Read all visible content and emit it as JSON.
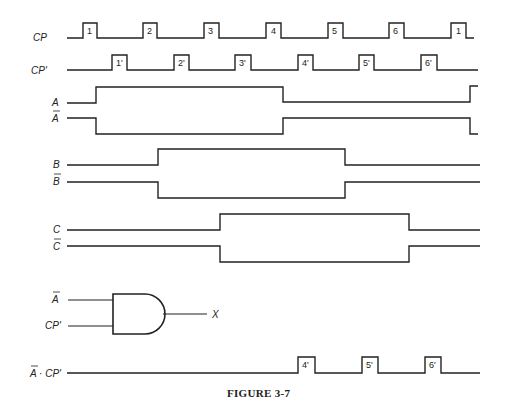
{
  "figure": {
    "caption": "FIGURE 3-7",
    "x_start": 67,
    "x_end": 480,
    "signals": [
      {
        "id": "CP",
        "label": "CP",
        "overbar": false,
        "y_high": 23,
        "y_low": 38,
        "points": [
          [
            67,
            38
          ],
          [
            83,
            38
          ],
          [
            83,
            23
          ],
          [
            97,
            23
          ],
          [
            97,
            38
          ],
          [
            143,
            38
          ],
          [
            143,
            23
          ],
          [
            157,
            23
          ],
          [
            157,
            38
          ],
          [
            204,
            38
          ],
          [
            204,
            23
          ],
          [
            219,
            23
          ],
          [
            219,
            38
          ],
          [
            266,
            38
          ],
          [
            266,
            23
          ],
          [
            281,
            23
          ],
          [
            281,
            38
          ],
          [
            328,
            38
          ],
          [
            328,
            23
          ],
          [
            343,
            23
          ],
          [
            343,
            38
          ],
          [
            389,
            38
          ],
          [
            389,
            23
          ],
          [
            404,
            23
          ],
          [
            404,
            38
          ],
          [
            451,
            38
          ],
          [
            451,
            23
          ],
          [
            466,
            23
          ],
          [
            466,
            38
          ],
          [
            474,
            38
          ]
        ],
        "pulses": [
          {
            "label": "1",
            "x": 87
          },
          {
            "label": "2",
            "x": 147
          },
          {
            "label": "3",
            "x": 208
          },
          {
            "label": "4",
            "x": 271
          },
          {
            "label": "5",
            "x": 332
          },
          {
            "label": "6",
            "x": 393
          },
          {
            "label": "1",
            "x": 456
          }
        ]
      },
      {
        "id": "CPprime",
        "label": "CP'",
        "overbar": false,
        "y_high": 55,
        "y_low": 70,
        "points": [
          [
            67,
            70
          ],
          [
            112,
            70
          ],
          [
            112,
            55
          ],
          [
            127,
            55
          ],
          [
            127,
            70
          ],
          [
            174,
            70
          ],
          [
            174,
            55
          ],
          [
            189,
            55
          ],
          [
            189,
            70
          ],
          [
            235,
            70
          ],
          [
            235,
            55
          ],
          [
            251,
            55
          ],
          [
            251,
            70
          ],
          [
            298,
            70
          ],
          [
            298,
            55
          ],
          [
            313,
            55
          ],
          [
            313,
            70
          ],
          [
            359,
            70
          ],
          [
            359,
            55
          ],
          [
            374,
            55
          ],
          [
            374,
            70
          ],
          [
            421,
            70
          ],
          [
            421,
            55
          ],
          [
            437,
            55
          ],
          [
            437,
            70
          ],
          [
            478,
            70
          ]
        ],
        "pulses": [
          {
            "label": "1'",
            "x": 116
          },
          {
            "label": "2'",
            "x": 178
          },
          {
            "label": "3'",
            "x": 239
          },
          {
            "label": "4'",
            "x": 302
          },
          {
            "label": "5'",
            "x": 363
          },
          {
            "label": "6'",
            "x": 425
          }
        ]
      },
      {
        "id": "A",
        "label": "A",
        "overbar": false,
        "points": [
          [
            67,
            103
          ],
          [
            96,
            103
          ],
          [
            96,
            87
          ],
          [
            283,
            87
          ],
          [
            283,
            102
          ],
          [
            470,
            102
          ],
          [
            470,
            86
          ],
          [
            478,
            86
          ]
        ]
      },
      {
        "id": "Abar",
        "label": "A",
        "overbar": true,
        "points": [
          [
            67,
            118
          ],
          [
            96,
            118
          ],
          [
            96,
            134
          ],
          [
            283,
            134
          ],
          [
            283,
            118
          ],
          [
            470,
            118
          ],
          [
            470,
            134
          ],
          [
            478,
            134
          ]
        ]
      },
      {
        "id": "B",
        "label": "B",
        "overbar": false,
        "points": [
          [
            67,
            165
          ],
          [
            158,
            165
          ],
          [
            158,
            149
          ],
          [
            345,
            149
          ],
          [
            345,
            165
          ],
          [
            480,
            165
          ]
        ]
      },
      {
        "id": "Bbar",
        "label": "B",
        "overbar": true,
        "points": [
          [
            67,
            182
          ],
          [
            158,
            182
          ],
          [
            158,
            198
          ],
          [
            345,
            198
          ],
          [
            345,
            182
          ],
          [
            480,
            182
          ]
        ]
      },
      {
        "id": "C",
        "label": "C",
        "overbar": false,
        "points": [
          [
            67,
            230
          ],
          [
            220,
            230
          ],
          [
            220,
            214
          ],
          [
            409,
            214
          ],
          [
            409,
            230
          ],
          [
            480,
            230
          ]
        ]
      },
      {
        "id": "Cbar",
        "label": "C",
        "overbar": true,
        "points": [
          [
            67,
            246
          ],
          [
            220,
            246
          ],
          [
            220,
            262
          ],
          [
            409,
            262
          ],
          [
            409,
            246
          ],
          [
            480,
            246
          ]
        ]
      },
      {
        "id": "AbarCPprime",
        "label": "A · CP'",
        "overbar": false,
        "points": [
          [
            67,
            373
          ],
          [
            298,
            373
          ],
          [
            298,
            357
          ],
          [
            315,
            357
          ],
          [
            315,
            373
          ],
          [
            362,
            373
          ],
          [
            362,
            357
          ],
          [
            378,
            357
          ],
          [
            378,
            373
          ],
          [
            425,
            373
          ],
          [
            425,
            357
          ],
          [
            441,
            357
          ],
          [
            441,
            373
          ],
          [
            480,
            373
          ]
        ],
        "pulses": [
          {
            "label": "4'",
            "x": 302
          },
          {
            "label": "5'",
            "x": 366
          },
          {
            "label": "6'",
            "x": 429
          }
        ]
      }
    ],
    "gate": {
      "type": "AND",
      "inputs": [
        {
          "label": "A",
          "overbar": true
        },
        {
          "label": "CP'",
          "overbar": false
        }
      ],
      "output": "X"
    }
  }
}
